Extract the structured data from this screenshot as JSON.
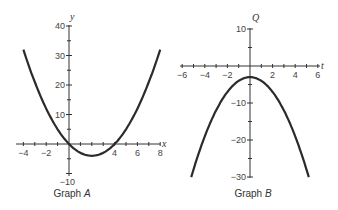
{
  "chart_data": [
    {
      "type": "line",
      "title": "Graph A",
      "caption": {
        "prefix": "Graph ",
        "letter": "A"
      },
      "xlabel": "x",
      "ylabel": "y",
      "xlim": [
        -4,
        8
      ],
      "ylim": [
        -10,
        40
      ],
      "x_ticks": [
        -4,
        -2,
        4,
        6,
        8
      ],
      "y_ticks": [
        40,
        30,
        20,
        10,
        -10
      ],
      "x_tick_labels": [
        "−4",
        "−2",
        "4",
        "6",
        "8"
      ],
      "y_tick_labels": [
        "40",
        "30",
        "20",
        "10",
        "−10"
      ],
      "function": "y = x^2 - 4x",
      "x": [
        -4,
        -2,
        0,
        2,
        4,
        6,
        8
      ],
      "values": [
        32,
        12,
        0,
        -4,
        0,
        12,
        32
      ],
      "grid": false,
      "color": "#2b2b2b"
    },
    {
      "type": "line",
      "title": "Graph B",
      "caption": {
        "prefix": "Graph ",
        "letter": "B"
      },
      "xlabel": "t",
      "ylabel": "Q",
      "xlim": [
        -6,
        6
      ],
      "ylim": [
        -30,
        10
      ],
      "x_ticks": [
        -6,
        -4,
        -2,
        2,
        4,
        6
      ],
      "y_ticks": [
        10,
        -10,
        -20,
        -30
      ],
      "x_tick_labels": [
        "−6",
        "−4",
        "−2",
        "2",
        "4",
        "6"
      ],
      "y_tick_labels": [
        "10",
        "−10",
        "−20",
        "−30"
      ],
      "function": "Q = -t^2 - 3",
      "x": [
        -5.2,
        -4,
        -2,
        0,
        2,
        4,
        5.2
      ],
      "values": [
        -30,
        -19,
        -7,
        -3,
        -7,
        -19,
        -30
      ],
      "grid": false,
      "color": "#2b2b2b"
    }
  ]
}
